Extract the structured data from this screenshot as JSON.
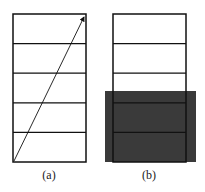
{
  "figure": {
    "panels": [
      {
        "id": "a",
        "label": "(a)",
        "box": {
          "x": 13,
          "y": 14,
          "width": 73,
          "height": 148
        },
        "rows": 5,
        "arrow": {
          "from": [
            13,
            162
          ],
          "to": [
            86,
            14
          ]
        }
      },
      {
        "id": "b",
        "label": "(b)",
        "box": {
          "x": 113,
          "y": 14,
          "width": 73,
          "height": 148
        },
        "rows": 5,
        "shaded_region": {
          "x": 105,
          "y": 91,
          "width": 91,
          "height": 71,
          "color": "#3a3a3a"
        }
      }
    ],
    "colors": {
      "line": "#111111",
      "background": "#ffffff",
      "shade": "#3a3a3a"
    }
  }
}
